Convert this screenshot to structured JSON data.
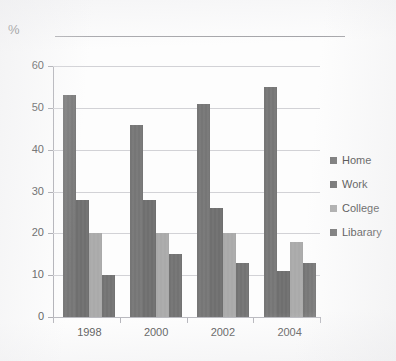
{
  "chart_data": {
    "type": "bar",
    "title": "",
    "subtitle": "",
    "xlabel": "",
    "ylabel": "%",
    "unit_label": "%",
    "categories": [
      "1998",
      "2000",
      "2002",
      "2004"
    ],
    "series": [
      {
        "name": "Home",
        "values": [
          53,
          28,
          51,
          55
        ],
        "color": "#767676"
      },
      {
        "name": "Work",
        "values": [
          28,
          28,
          26,
          11
        ],
        "color": "#6f6f6f"
      },
      {
        "name": "College",
        "values": [
          20,
          20,
          20,
          18
        ],
        "color": "#aaaaaa"
      },
      {
        "name": "Libarary",
        "values": [
          10,
          15,
          13,
          13
        ],
        "color": "#737373"
      }
    ],
    "ylim": [
      0,
      60
    ],
    "ytick_labels": [
      "0",
      "10",
      "20",
      "30",
      "40",
      "50",
      "60"
    ],
    "ytick_values": [
      0,
      10,
      20,
      30,
      40,
      50,
      60
    ],
    "grid": true,
    "grid_axis": "y",
    "legend_position": "right",
    "legend_entries": [
      "Home",
      "Work",
      "College",
      "Libarary"
    ]
  },
  "axes": {
    "y_label": "%",
    "y_ticks": [
      {
        "label": "60",
        "value": 60
      },
      {
        "label": "50",
        "value": 50
      },
      {
        "label": "40",
        "value": 40
      },
      {
        "label": "30",
        "value": 30
      },
      {
        "label": "20",
        "value": 20
      },
      {
        "label": "10",
        "value": 10
      },
      {
        "label": "0",
        "value": 0
      }
    ],
    "x_ticks": [
      {
        "label": "1998"
      },
      {
        "label": "2000"
      },
      {
        "label": "2002"
      },
      {
        "label": "2004"
      }
    ]
  },
  "legend": {
    "items": [
      {
        "label": "Home",
        "color": "#767676"
      },
      {
        "label": "Work",
        "color": "#6f6f6f"
      },
      {
        "label": "College",
        "color": "#aaaaaa"
      },
      {
        "label": "Libarary",
        "color": "#737373"
      }
    ]
  },
  "groups": [
    {
      "category": "1998",
      "bars": [
        {
          "series": "Home",
          "value": 53
        },
        {
          "series": "Work",
          "value": 28
        },
        {
          "series": "College",
          "value": 20
        },
        {
          "series": "Libarary",
          "value": 10
        }
      ]
    },
    {
      "category": "2000",
      "bars": [
        {
          "series": "Home",
          "value": 46
        },
        {
          "series": "Work",
          "value": 28
        },
        {
          "series": "College",
          "value": 20
        },
        {
          "series": "Libarary",
          "value": 15
        }
      ]
    },
    {
      "category": "2002",
      "bars": [
        {
          "series": "Home",
          "value": 51
        },
        {
          "series": "Work",
          "value": 26
        },
        {
          "series": "College",
          "value": 20
        },
        {
          "series": "Libarary",
          "value": 13
        }
      ]
    },
    {
      "category": "2004",
      "bars": [
        {
          "series": "Home",
          "value": 55
        },
        {
          "series": "Work",
          "value": 11
        },
        {
          "series": "College",
          "value": 18
        },
        {
          "series": "Libarary",
          "value": 13
        }
      ]
    }
  ]
}
